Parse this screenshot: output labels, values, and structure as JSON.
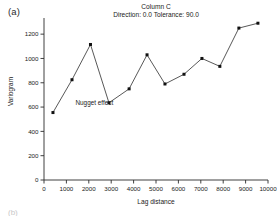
{
  "panel": {
    "label": "(a)"
  },
  "figure": {
    "title": "Column C",
    "subtitle": "Direction: 0.0 Tolerance: 90.0",
    "bottom_fragment": "(b)"
  },
  "annotations": [
    {
      "text": "Nugget effect",
      "x": 2250,
      "y": 620
    }
  ],
  "axes": {
    "x_tick_labels": [
      "0",
      "1000",
      "2000",
      "3000",
      "4000",
      "5000",
      "6000",
      "7000",
      "8000",
      "9000",
      "10000"
    ],
    "y_tick_labels": [
      "0",
      "200",
      "400",
      "600",
      "800",
      "1000",
      "1200"
    ]
  },
  "style": {
    "line_color": "#3a3a3a",
    "marker_color": "#111111",
    "axis_color": "#2b2b2b"
  },
  "chart_data": {
    "type": "line",
    "title": "Column C",
    "subtitle": "Direction: 0.0 Tolerance: 90.0",
    "xlabel": "Lag distance",
    "ylabel": "Variogram",
    "xlim": [
      0,
      10000
    ],
    "ylim": [
      0,
      1300
    ],
    "xticks": [
      0,
      1000,
      2000,
      3000,
      4000,
      5000,
      6000,
      7000,
      8000,
      9000,
      10000
    ],
    "yticks": [
      0,
      200,
      400,
      600,
      800,
      1000,
      1200
    ],
    "grid": false,
    "legend": false,
    "marker": "square",
    "series": [
      {
        "name": "Variogram",
        "x": [
          400,
          1250,
          2075,
          2900,
          3800,
          4600,
          5400,
          6250,
          7050,
          7850,
          8700,
          9550
        ],
        "values": [
          555,
          825,
          1115,
          635,
          750,
          1030,
          790,
          870,
          1000,
          935,
          1250,
          1290
        ]
      }
    ]
  }
}
